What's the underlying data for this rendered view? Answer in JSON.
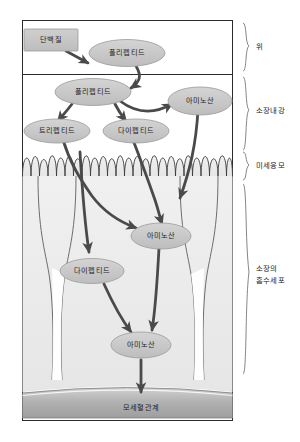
{
  "diagram": {
    "regions": [
      {
        "id": "stomach",
        "label": "위"
      },
      {
        "id": "lumen",
        "label": "소장내강"
      },
      {
        "id": "microvilli",
        "label": "미세융모"
      },
      {
        "id": "absorptive",
        "label": "소장의\n흡수세포"
      }
    ],
    "nodes": [
      {
        "id": "protein",
        "label": "단백질",
        "shape": "rect",
        "region": "stomach"
      },
      {
        "id": "polypeptide1",
        "label": "폴리펩티드",
        "shape": "ellipse",
        "region": "stomach"
      },
      {
        "id": "polypeptide2",
        "label": "폴리펩티드",
        "shape": "ellipse",
        "region": "lumen"
      },
      {
        "id": "aminoacid1",
        "label": "아미노산",
        "shape": "ellipse",
        "region": "lumen"
      },
      {
        "id": "tripeptide",
        "label": "트리펩티드",
        "shape": "ellipse",
        "region": "lumen"
      },
      {
        "id": "dipeptide1",
        "label": "다이펩티드",
        "shape": "ellipse",
        "region": "lumen"
      },
      {
        "id": "aminoacid2",
        "label": "아미노산",
        "shape": "ellipse",
        "region": "absorptive"
      },
      {
        "id": "dipeptide2",
        "label": "다이펩티드",
        "shape": "ellipse",
        "region": "absorptive"
      },
      {
        "id": "aminoacid3",
        "label": "아미노산",
        "shape": "ellipse",
        "region": "absorptive"
      },
      {
        "id": "capillary",
        "label": "모세혈관계",
        "shape": "bar",
        "region": "blood"
      }
    ],
    "region_labels": {
      "stomach": "위",
      "lumen": "소장내강",
      "microvilli": "미세융모",
      "absorptive_line1": "소장의",
      "absorptive_line2": "흡수세포"
    },
    "colors": {
      "node_fill": "#c9c9c9",
      "node_stroke": "#8a8a8a",
      "arrow": "#4a4a4a",
      "frame": "#2b2b2b",
      "cell_fill": "#eeeeee",
      "capillary": "#b5b5b5",
      "text": "#1c1c1c"
    }
  }
}
